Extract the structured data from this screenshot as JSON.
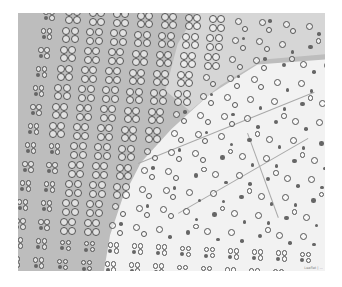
{
  "map": {
    "colors": {
      "dark_region": "#bdbdbd",
      "light_region": "#f2f2f2",
      "marker_stroke": "#555555"
    },
    "attribution": "Leaflet | ...",
    "grid": {
      "rows": 14,
      "cols": 13,
      "cell_w": 24,
      "cell_h": 19,
      "skew": 0.28,
      "origin_x": -6,
      "origin_y": 2
    },
    "cluster_types": [
      "quad-large",
      "quad-small",
      "pair",
      "single-ring",
      "single-dot"
    ]
  }
}
